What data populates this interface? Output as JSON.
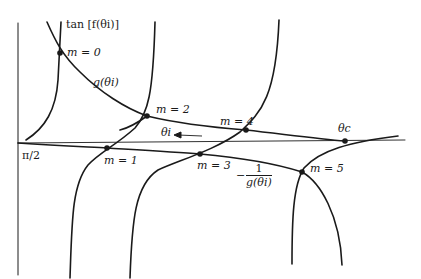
{
  "diagram": {
    "labels": {
      "y_axis": "tan [f(θi)]",
      "g_curve": "g(θi)",
      "neg_inv_g_sign": "−",
      "neg_inv_g_num": "1",
      "neg_inv_g_den": "g(θi)",
      "theta_i": "θi",
      "theta_c": "θc",
      "origin": "π/2",
      "m0": "m = 0",
      "m1": "m = 1",
      "m2": "m = 2",
      "m3": "m = 3",
      "m4": "m = 4",
      "m5": "m = 5"
    },
    "intersections": [
      {
        "name": "m = 0",
        "x": 60,
        "y": 53
      },
      {
        "name": "m = 1",
        "x": 107,
        "y": 148
      },
      {
        "name": "m = 2",
        "x": 147,
        "y": 116
      },
      {
        "name": "m = 3",
        "x": 200,
        "y": 154
      },
      {
        "name": "m = 4",
        "x": 246,
        "y": 130
      },
      {
        "name": "m = 5",
        "x": 302,
        "y": 172
      },
      {
        "name": "θc",
        "x": 345,
        "y": 141
      }
    ],
    "line_color": "#1a1a1a"
  }
}
